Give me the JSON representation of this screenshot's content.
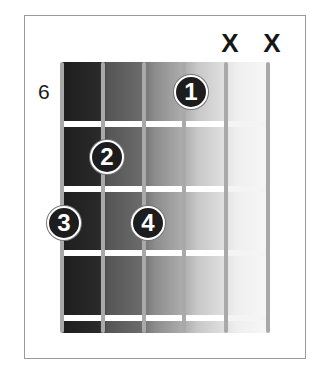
{
  "diagram": {
    "type": "guitar-chord-diagram",
    "starting_fret_label": "6",
    "muted_strings": [
      {
        "string": 5,
        "label": "X"
      },
      {
        "string": 6,
        "label": "X"
      }
    ],
    "fingers": [
      {
        "label": "1",
        "string": 4,
        "fret": 1
      },
      {
        "label": "2",
        "string": 2,
        "fret": 2
      },
      {
        "label": "3",
        "string": 1,
        "fret": 3
      },
      {
        "label": "4",
        "string": 3,
        "fret": 3
      }
    ],
    "strings_count": 6,
    "frets_count": 4,
    "colors": {
      "dot_fill": "#1d1d1d",
      "dot_text": "#ffffff",
      "string": "#a9a9a9",
      "fret": "#ffffff",
      "frame": "#9a9a9a"
    }
  }
}
